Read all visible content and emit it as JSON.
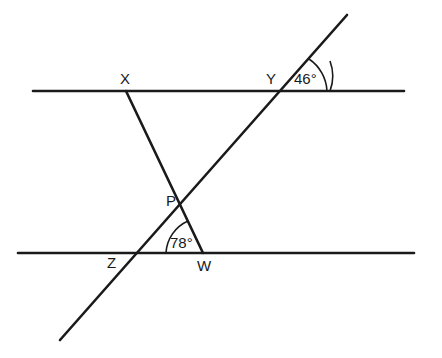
{
  "diagram": {
    "type": "geometry-parallel-lines-transversal",
    "points": {
      "X": "X",
      "Y": "Y",
      "P": "P",
      "Z": "Z",
      "W": "W"
    },
    "angles": {
      "at_Y": "46°",
      "at_W": "78°"
    },
    "lines": [
      {
        "name": "upper-parallel-line",
        "through": [
          "X",
          "Y"
        ]
      },
      {
        "name": "lower-parallel-line",
        "through": [
          "Z",
          "W"
        ]
      },
      {
        "name": "transversal-line",
        "through": [
          "Z",
          "P",
          "Y"
        ]
      },
      {
        "name": "segment-XW",
        "through": [
          "X",
          "P",
          "W"
        ]
      }
    ],
    "stroke_color": "#1a1a1a",
    "background_color": "#ffffff"
  }
}
